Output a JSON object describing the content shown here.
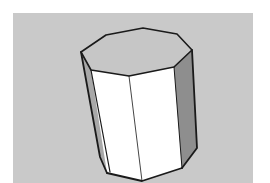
{
  "scene": {
    "description": "3D octagonal prism (cylinder-like) rendered in a modeling viewport",
    "colors": {
      "page_bg": "#ffffff",
      "viewport_bg": "#c9c9c9",
      "top_face": "#c6c6c6",
      "front_faces": "#ffffff",
      "left_side_face": "#a8a8a8",
      "right_side_face": "#8e8e8e",
      "edge": "#1a1a1a"
    }
  }
}
